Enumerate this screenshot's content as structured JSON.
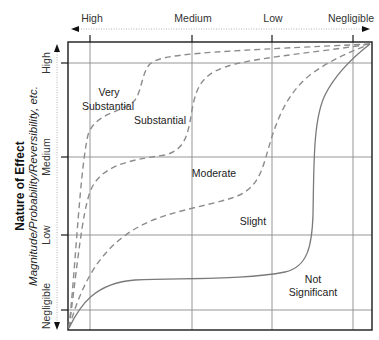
{
  "diagram": {
    "top_axis": {
      "labels": [
        "High",
        "Medium",
        "Low",
        "Negligible"
      ]
    },
    "left_axis": {
      "title": "Nature of Effect",
      "subtitle": "Magnitude/Probability/Reversibility, etc.",
      "labels": [
        "High",
        "Medium",
        "Low",
        "Negligible"
      ]
    },
    "regions": {
      "very_substantial_line1": "Very",
      "very_substantial_line2": "Substantial",
      "substantial": "Substantial",
      "moderate": "Moderate",
      "slight": "Slight",
      "not_significant_line1": "Not",
      "not_significant_line2": "Significant"
    },
    "colors": {
      "frame": "#1a1a1a",
      "grid": "#8a8a8a",
      "dashed_curve": "#8c8c8c",
      "solid_curve": "#7a7a7a"
    }
  }
}
